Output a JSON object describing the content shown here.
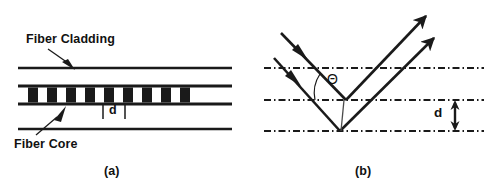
{
  "figure": {
    "caption_a": "(a)",
    "caption_b": "(b)",
    "ink_color": "#1a1a1a",
    "background_color": "#ffffff"
  },
  "panel_a": {
    "name": "fiber-grating-cross-section",
    "labels": {
      "cladding": "Fiber Cladding",
      "core": "Fiber Core",
      "period": "d"
    },
    "geometry": {
      "top_cladding_line_y": 68,
      "core_top_line_y": 86,
      "core_bottom_line_y": 104,
      "bottom_cladding_line_y": 129,
      "line_left_x": 18,
      "line_right_x": 232,
      "grating_left_x": 28,
      "grating_right_x": 196,
      "grating_block_count": 9,
      "grating_period_px": 19,
      "grating_block_width_px": 10
    }
  },
  "panel_b": {
    "name": "ray-reflection-geometry",
    "labels": {
      "angle": "Θ",
      "spacing": "d"
    },
    "geometry": {
      "dashdot_line_1_y": 68,
      "dashdot_line_2_y": 100,
      "dashdot_line_3_y": 131,
      "line_left_x": 16,
      "line_right_x": 236,
      "upper_vertex_x": 98,
      "upper_vertex_y": 100,
      "lower_vertex_x": 92,
      "lower_vertex_y": 131,
      "incoming_ray_count": 2,
      "outgoing_ray_count": 2,
      "spacing_arrow_x": 207
    }
  }
}
